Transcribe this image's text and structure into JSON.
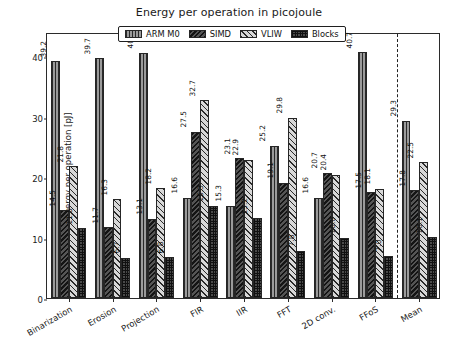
{
  "chart_data": {
    "type": "bar",
    "title": "Energy per operation in picojoule",
    "xlabel": "",
    "ylabel": "Energy per operation [pJ]",
    "ylim": [
      0,
      44
    ],
    "yticks": [
      0,
      10,
      20,
      30,
      40
    ],
    "grid": false,
    "legend_position": "upper center",
    "categories": [
      "Binarization",
      "Erosion",
      "Projection",
      "FIR",
      "IIR",
      "FFT",
      "2D conv.",
      "FFoS",
      "Mean"
    ],
    "series": [
      {
        "name": "ARM M0",
        "pattern": "vertical-lines",
        "color": "#9b9b9b",
        "values": [
          39.2,
          39.7,
          40.6,
          16.6,
          15.3,
          25.2,
          16.6,
          40.7,
          29.3
        ]
      },
      {
        "name": "SIMD",
        "pattern": "dense-diagonal",
        "color": "#555555",
        "values": [
          14.5,
          11.7,
          13.1,
          27.5,
          23.1,
          19.1,
          20.7,
          17.5,
          17.8
        ]
      },
      {
        "name": "VLIW",
        "pattern": "light-diagonal",
        "color": "#d8d8d8",
        "values": [
          21.8,
          16.3,
          18.2,
          32.7,
          22.9,
          29.8,
          20.4,
          18.1,
          22.5
        ]
      },
      {
        "name": "Blocks",
        "pattern": "crosshatch",
        "color": "#4a4a4a",
        "values": [
          11.5,
          6.7,
          6.8,
          15.3,
          13.2,
          7.8,
          10.0,
          7.0,
          10.1
        ]
      }
    ],
    "separator_before": "Mean",
    "annotations": "Each bar is labelled with its value rotated 90 degrees."
  },
  "caption": ""
}
